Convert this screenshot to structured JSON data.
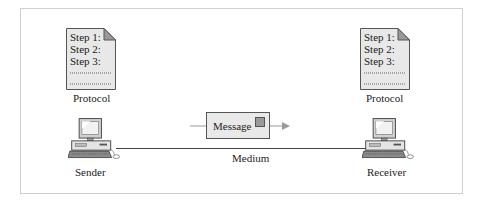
{
  "diagram": {
    "sender": {
      "protocol_doc": {
        "lines": [
          "Step 1:",
          "Step 2:",
          "Step 3:"
        ]
      },
      "protocol_label": "Protocol",
      "device_label": "Sender"
    },
    "receiver": {
      "protocol_doc": {
        "lines": [
          "Step 1:",
          "Step 2:",
          "Step 3:"
        ]
      },
      "protocol_label": "Protocol",
      "device_label": "Receiver"
    },
    "message": {
      "label": "Message"
    },
    "medium": {
      "label": "Medium"
    },
    "colors": {
      "doc_fill": "#e8e8e8",
      "arrow": "#9a9a9a",
      "border": "#cfcfcf",
      "line": "#444444"
    }
  }
}
